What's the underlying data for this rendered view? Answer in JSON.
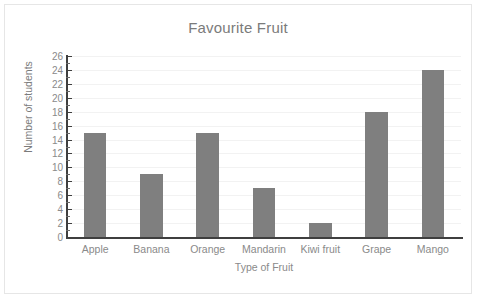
{
  "chart_data": {
    "type": "bar",
    "title": "Favourite Fruit",
    "xlabel": "Type of Fruit",
    "ylabel": "Number of students",
    "categories": [
      "Apple",
      "Banana",
      "Orange",
      "Mandarin",
      "Kiwi fruit",
      "Grape",
      "Mango"
    ],
    "values": [
      15,
      9,
      15,
      7,
      2,
      18,
      24
    ],
    "ylim": [
      0,
      26
    ],
    "ytick_step": 2,
    "yticks": [
      0,
      2,
      4,
      6,
      8,
      10,
      12,
      14,
      16,
      18,
      20,
      22,
      24,
      26
    ],
    "ytick_labels": [
      "0",
      "2",
      "4",
      "6",
      "8",
      "10",
      "12",
      "14",
      "16",
      "18",
      "20",
      "22",
      "24",
      "26"
    ],
    "minor_tick_step": 1,
    "grid": true,
    "grid_axis": "y",
    "legend": false,
    "bar_color": "#7f7f7f",
    "grid_color": "#f2f2f2",
    "axis_color": "#3f3f3f",
    "text_color": "#8a8a8a",
    "title_color": "#7b7b7b",
    "background_color": "#ffffff",
    "border_color": "#e6e6e6"
  }
}
